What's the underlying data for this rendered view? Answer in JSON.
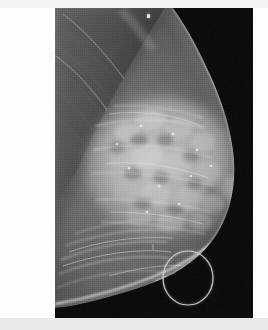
{
  "image": {
    "modality": "mammogram",
    "view": "mediolateral-oblique",
    "laterality_side": "left",
    "background_color": "#050505",
    "page_background": "#ffffff",
    "band_top_color": "#f3f3f3",
    "band_bottom_color": "#e9e9e9"
  },
  "film": {
    "left": 55,
    "top": 8,
    "width": 198,
    "height": 310
  },
  "annotation": {
    "shape": "circle",
    "label": "region-of-interest",
    "stroke_color": "#cfcfcf",
    "center_x": 188,
    "center_y": 278,
    "radius_x": 25,
    "radius_y": 27,
    "stroke_width": 1.2
  },
  "marker": {
    "label": "skin-marker",
    "x": 147,
    "y": 14,
    "color": "#e8e8e8"
  },
  "anatomy": {
    "pectoral_muscle": "pectoral-muscle",
    "fibroglandular_tissue": "fibroglandular-tissue",
    "skin_line": "skin-line",
    "inframammary_fold": "inframammary-fold",
    "nipple": "nipple",
    "air_background": "air-background"
  }
}
